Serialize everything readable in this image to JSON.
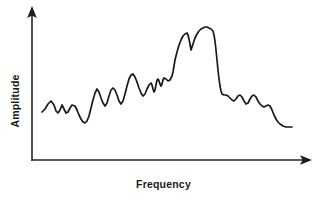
{
  "chart_data": {
    "type": "line",
    "title": "",
    "xlabel": "Frequency",
    "ylabel": "Amplitude",
    "axes": {
      "x_axis_shown": true,
      "y_axis_shown": true,
      "x_tick_labels": [],
      "y_tick_labels": [],
      "grid": false,
      "arrowheads": true,
      "origin_px": [
        32,
        160
      ],
      "x_axis_end_px": [
        311,
        160
      ],
      "y_axis_end_px": [
        32,
        8
      ]
    },
    "legend": {
      "shown": false,
      "entries": []
    },
    "annotations": [],
    "series": [
      {
        "name": "spectrum",
        "color": "#1a1a1a",
        "description": "Hand-drawn frequency spectrum: noisy low plateau on the left, a single tall broad resonance peak near mid-right with a sharp right-hand cliff, then a descending noisy tail.",
        "points_px": [
          [
            42,
            112
          ],
          [
            45,
            109
          ],
          [
            48,
            104
          ],
          [
            51,
            101
          ],
          [
            54,
            105
          ],
          [
            56,
            111
          ],
          [
            58,
            113
          ],
          [
            60,
            110
          ],
          [
            62,
            105
          ],
          [
            64,
            109
          ],
          [
            66,
            113
          ],
          [
            68,
            112
          ],
          [
            70,
            108
          ],
          [
            72,
            105
          ],
          [
            75,
            106
          ],
          [
            77,
            110
          ],
          [
            79,
            115
          ],
          [
            81,
            119
          ],
          [
            83,
            122
          ],
          [
            85,
            123
          ],
          [
            87,
            121
          ],
          [
            89,
            116
          ],
          [
            91,
            108
          ],
          [
            93,
            100
          ],
          [
            95,
            93
          ],
          [
            97,
            89
          ],
          [
            99,
            92
          ],
          [
            101,
            98
          ],
          [
            103,
            103
          ],
          [
            105,
            106
          ],
          [
            107,
            103
          ],
          [
            109,
            96
          ],
          [
            111,
            90
          ],
          [
            113,
            88
          ],
          [
            115,
            90
          ],
          [
            117,
            95
          ],
          [
            119,
            101
          ],
          [
            121,
            104
          ],
          [
            123,
            101
          ],
          [
            125,
            94
          ],
          [
            127,
            86
          ],
          [
            129,
            79
          ],
          [
            131,
            75
          ],
          [
            133,
            74
          ],
          [
            135,
            77
          ],
          [
            137,
            82
          ],
          [
            139,
            88
          ],
          [
            141,
            93
          ],
          [
            143,
            96
          ],
          [
            145,
            94
          ],
          [
            147,
            89
          ],
          [
            149,
            85
          ],
          [
            151,
            83
          ],
          [
            152,
            85
          ],
          [
            153,
            89
          ],
          [
            154,
            92
          ],
          [
            155,
            90
          ],
          [
            156,
            85
          ],
          [
            157,
            80
          ],
          [
            158,
            79
          ],
          [
            159,
            81
          ],
          [
            160,
            84
          ],
          [
            161,
            86
          ],
          [
            162,
            84
          ],
          [
            163,
            80
          ],
          [
            164,
            78
          ],
          [
            166,
            79
          ],
          [
            168,
            81
          ],
          [
            170,
            80
          ],
          [
            172,
            76
          ],
          [
            173,
            72
          ],
          [
            174,
            66
          ],
          [
            175,
            60
          ],
          [
            177,
            52
          ],
          [
            179,
            45
          ],
          [
            181,
            40
          ],
          [
            183,
            36
          ],
          [
            185,
            34
          ],
          [
            187,
            33
          ],
          [
            188,
            35
          ],
          [
            189,
            39
          ],
          [
            190,
            44
          ],
          [
            191,
            50
          ],
          [
            193,
            44
          ],
          [
            195,
            38
          ],
          [
            197,
            34
          ],
          [
            199,
            31
          ],
          [
            201,
            29
          ],
          [
            203,
            28
          ],
          [
            205,
            27
          ],
          [
            207,
            27
          ],
          [
            209,
            28
          ],
          [
            211,
            29
          ],
          [
            213,
            31
          ],
          [
            214,
            35
          ],
          [
            215,
            41
          ],
          [
            216,
            50
          ],
          [
            217,
            60
          ],
          [
            218,
            70
          ],
          [
            219,
            79
          ],
          [
            220,
            86
          ],
          [
            221,
            91
          ],
          [
            222,
            94
          ],
          [
            224,
            95
          ],
          [
            226,
            95
          ],
          [
            228,
            96
          ],
          [
            230,
            98
          ],
          [
            232,
            100
          ],
          [
            234,
            101
          ],
          [
            236,
            99
          ],
          [
            238,
            96
          ],
          [
            240,
            95
          ],
          [
            242,
            97
          ],
          [
            244,
            101
          ],
          [
            246,
            104
          ],
          [
            248,
            103
          ],
          [
            250,
            99
          ],
          [
            252,
            96
          ],
          [
            254,
            95
          ],
          [
            256,
            97
          ],
          [
            258,
            101
          ],
          [
            260,
            104
          ],
          [
            262,
            106
          ],
          [
            264,
            107
          ],
          [
            266,
            106
          ],
          [
            268,
            105
          ],
          [
            270,
            106
          ],
          [
            272,
            110
          ],
          [
            274,
            115
          ],
          [
            276,
            119
          ],
          [
            278,
            122
          ],
          [
            280,
            124
          ],
          [
            283,
            126
          ],
          [
            286,
            127
          ],
          [
            289,
            127
          ],
          [
            292,
            127
          ]
        ]
      }
    ],
    "xlim_px": [
      32,
      311
    ],
    "ylim_px": [
      160,
      8
    ]
  },
  "labels": {
    "x_axis": "Frequency",
    "y_axis": "Amplitude"
  },
  "colors": {
    "background": "#ffffff",
    "ink": "#1a1a1a",
    "axis": "#262626"
  }
}
